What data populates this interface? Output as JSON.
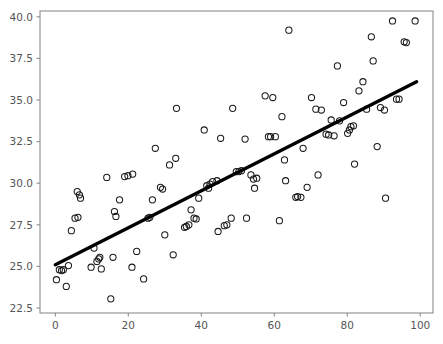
{
  "chart_data": {
    "type": "scatter",
    "title": "",
    "xlabel": "",
    "ylabel": "",
    "xlim": [
      -4.2,
      103.5
    ],
    "ylim": [
      22.2,
      40.35
    ],
    "xticks": [
      0,
      20,
      40,
      60,
      80,
      100
    ],
    "yticks": [
      22.5,
      25.0,
      27.5,
      30.0,
      32.5,
      35.0,
      37.5,
      40.0
    ],
    "xticklabels": [
      "0",
      "20",
      "40",
      "60",
      "80",
      "100"
    ],
    "yticklabels": [
      "22.5",
      "25.0",
      "27.5",
      "30.0",
      "32.5",
      "35.0",
      "37.5",
      "40.0"
    ],
    "grid": false,
    "legend": null,
    "marker": {
      "style": "open-circle",
      "facecolor": "none",
      "edgecolor": "#1a1a1a",
      "size": 6.2,
      "linewidth": 1.05
    },
    "series": [
      {
        "name": "observations",
        "type": "scatter",
        "points": [
          [
            0.3,
            24.2
          ],
          [
            1.1,
            24.8
          ],
          [
            1.7,
            24.75
          ],
          [
            2.2,
            24.8
          ],
          [
            3.0,
            23.8
          ],
          [
            3.6,
            25.05
          ],
          [
            4.4,
            27.15
          ],
          [
            5.4,
            27.9
          ],
          [
            6.2,
            27.95
          ],
          [
            6.0,
            29.5
          ],
          [
            6.6,
            29.3
          ],
          [
            6.9,
            29.1
          ],
          [
            9.8,
            24.95
          ],
          [
            10.6,
            26.1
          ],
          [
            11.4,
            25.3
          ],
          [
            11.9,
            25.45
          ],
          [
            12.2,
            25.55
          ],
          [
            12.6,
            24.85
          ],
          [
            14.1,
            30.35
          ],
          [
            15.2,
            23.05
          ],
          [
            15.8,
            25.55
          ],
          [
            16.2,
            28.3
          ],
          [
            16.6,
            28.0
          ],
          [
            17.6,
            29.0
          ],
          [
            19.0,
            30.4
          ],
          [
            19.9,
            30.45
          ],
          [
            21.2,
            30.55
          ],
          [
            21.0,
            24.95
          ],
          [
            22.3,
            25.9
          ],
          [
            24.2,
            24.25
          ],
          [
            25.4,
            27.9
          ],
          [
            25.9,
            27.95
          ],
          [
            26.6,
            29.0
          ],
          [
            27.4,
            32.1
          ],
          [
            28.8,
            29.75
          ],
          [
            29.4,
            29.65
          ],
          [
            30.0,
            26.9
          ],
          [
            31.3,
            31.1
          ],
          [
            32.3,
            25.7
          ],
          [
            33.0,
            31.5
          ],
          [
            33.2,
            34.5
          ],
          [
            35.4,
            27.35
          ],
          [
            35.9,
            27.4
          ],
          [
            36.6,
            27.5
          ],
          [
            37.2,
            28.4
          ],
          [
            38.0,
            27.9
          ],
          [
            38.6,
            27.85
          ],
          [
            39.3,
            29.1
          ],
          [
            40.8,
            33.2
          ],
          [
            41.5,
            29.85
          ],
          [
            42.0,
            29.7
          ],
          [
            42.4,
            29.95
          ],
          [
            43.1,
            30.1
          ],
          [
            44.3,
            30.15
          ],
          [
            44.6,
            27.1
          ],
          [
            45.3,
            32.7
          ],
          [
            46.3,
            27.45
          ],
          [
            47.0,
            27.5
          ],
          [
            48.2,
            27.9
          ],
          [
            48.6,
            34.5
          ],
          [
            49.6,
            30.7
          ],
          [
            50.3,
            30.7
          ],
          [
            51.0,
            30.75
          ],
          [
            52.0,
            32.65
          ],
          [
            52.4,
            27.9
          ],
          [
            53.6,
            30.5
          ],
          [
            54.3,
            30.25
          ],
          [
            54.6,
            29.7
          ],
          [
            55.2,
            30.3
          ],
          [
            57.5,
            35.25
          ],
          [
            58.4,
            32.8
          ],
          [
            59.0,
            32.8
          ],
          [
            59.6,
            35.15
          ],
          [
            60.3,
            32.8
          ],
          [
            61.4,
            27.75
          ],
          [
            62.1,
            34.0
          ],
          [
            62.8,
            31.4
          ],
          [
            63.1,
            30.15
          ],
          [
            64.0,
            39.2
          ],
          [
            65.9,
            29.15
          ],
          [
            66.4,
            29.2
          ],
          [
            67.3,
            29.15
          ],
          [
            67.9,
            32.1
          ],
          [
            69.0,
            29.75
          ],
          [
            70.2,
            35.15
          ],
          [
            71.4,
            34.45
          ],
          [
            72.0,
            30.5
          ],
          [
            72.9,
            34.4
          ],
          [
            74.2,
            32.95
          ],
          [
            74.9,
            32.9
          ],
          [
            75.6,
            33.8
          ],
          [
            76.4,
            32.85
          ],
          [
            77.3,
            37.05
          ],
          [
            77.9,
            33.75
          ],
          [
            79.0,
            34.85
          ],
          [
            80.1,
            33.0
          ],
          [
            80.6,
            33.2
          ],
          [
            81.0,
            33.4
          ],
          [
            81.7,
            33.45
          ],
          [
            82.0,
            31.15
          ],
          [
            83.2,
            35.55
          ],
          [
            84.3,
            36.1
          ],
          [
            85.3,
            34.45
          ],
          [
            86.6,
            38.8
          ],
          [
            87.1,
            37.35
          ],
          [
            88.2,
            32.2
          ],
          [
            89.1,
            34.55
          ],
          [
            90.2,
            34.4
          ],
          [
            90.5,
            29.1
          ],
          [
            92.4,
            39.75
          ],
          [
            93.5,
            35.05
          ],
          [
            94.2,
            35.05
          ],
          [
            95.6,
            38.5
          ],
          [
            96.2,
            38.45
          ],
          [
            98.6,
            39.75
          ]
        ]
      },
      {
        "name": "regression-line",
        "type": "line",
        "color": "#000000",
        "linewidth": 3.4,
        "endpoints": [
          [
            0.0,
            25.1
          ],
          [
            99.0,
            36.1
          ]
        ],
        "slope": 0.1111,
        "intercept": 25.1
      }
    ]
  },
  "axes": {
    "facecolor": "#ffffff",
    "spine_color": "#8d8d8d",
    "tick_label_color": "#555555"
  }
}
